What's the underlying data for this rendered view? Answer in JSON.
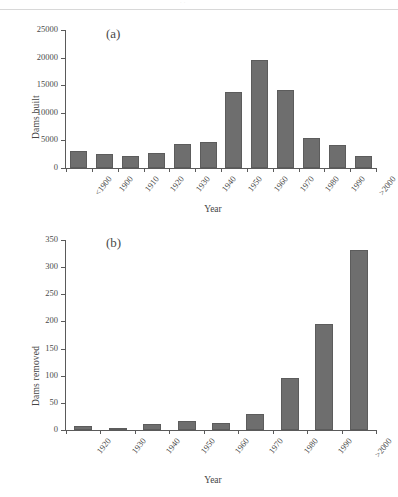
{
  "header": {
    "ghost_text": "· ·"
  },
  "figure": {
    "panels": [
      {
        "label": "(a)",
        "ylabel": "Dams built",
        "xlabel": "Year"
      },
      {
        "label": "(b)",
        "ylabel": "Dams removed",
        "xlabel": "Year"
      }
    ]
  },
  "colors": {
    "bar_fill": "#6e6e6e",
    "bar_stroke": "#5c5c5c",
    "axis": "#5a5a5a",
    "text": "#4a4a4a"
  },
  "chart_data": [
    {
      "type": "bar",
      "title": "(a)",
      "xlabel": "Year",
      "ylabel": "Dams built",
      "categories": [
        "<1900",
        "1900",
        "1910",
        "1920",
        "1930",
        "1940",
        "1950",
        "1960",
        "1970",
        "1980",
        "1990",
        ">2000"
      ],
      "values": [
        3000,
        2500,
        2200,
        2700,
        4400,
        4700,
        13700,
        19600,
        14200,
        5400,
        4100,
        2100
      ],
      "ylim": [
        0,
        25000
      ],
      "yticks": [
        0,
        5000,
        10000,
        15000,
        20000,
        25000
      ],
      "ytick_labels": [
        "0",
        "5000",
        "10000",
        "15000",
        "20000",
        "25000"
      ],
      "grid": false,
      "legend": false
    },
    {
      "type": "bar",
      "title": "(b)",
      "xlabel": "Year",
      "ylabel": "Dams removed",
      "categories": [
        "1920",
        "1930",
        "1940",
        "1950",
        "1960",
        "1970",
        "1980",
        "1990",
        ">2000"
      ],
      "values": [
        7,
        3,
        11,
        16,
        13,
        29,
        96,
        195,
        331
      ],
      "ylim": [
        0,
        350
      ],
      "yticks": [
        0,
        50,
        100,
        150,
        200,
        250,
        300,
        350
      ],
      "ytick_labels": [
        "0",
        "50",
        "100",
        "150",
        "200",
        "250",
        "300",
        "350"
      ],
      "grid": false,
      "legend": false
    }
  ]
}
